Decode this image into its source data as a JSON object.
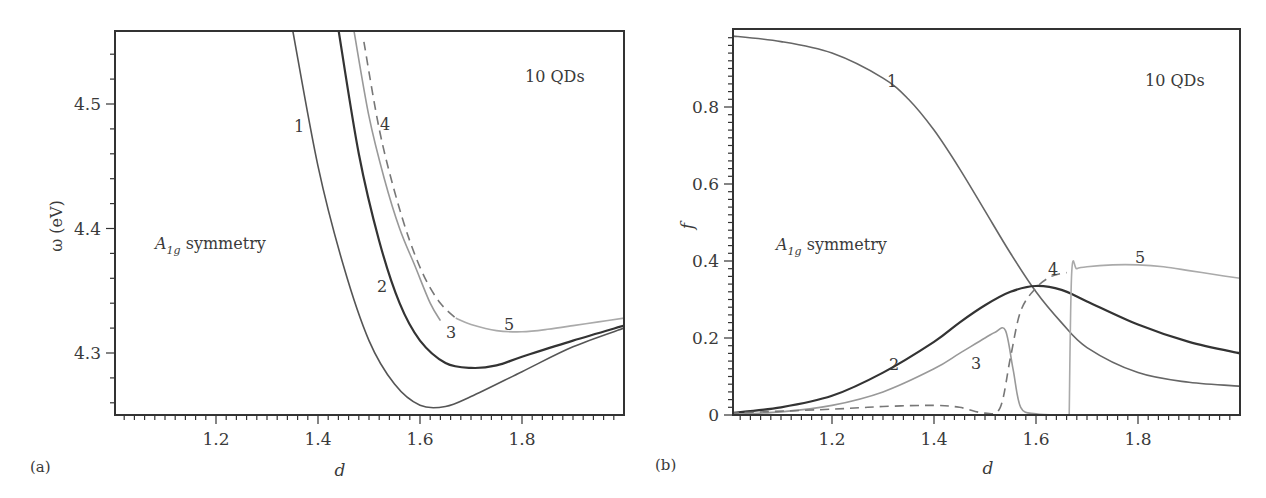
{
  "figure": {
    "panels": [
      {
        "id": "a",
        "panel_label": "(a)",
        "xlabel": "d",
        "ylabel": "ω (eV)",
        "annotation_top": "10 QDs",
        "annotation_symmetry": "A",
        "annotation_symmetry_sub": "1g",
        "annotation_symmetry_text": " symmetry",
        "xticks": [
          "1.2",
          "1.4",
          "1.6",
          "1.8"
        ],
        "yticks": [
          "4.3",
          "4.4",
          "4.5"
        ],
        "curve_labels": [
          "1",
          "2",
          "3",
          "4",
          "5"
        ]
      },
      {
        "id": "b",
        "panel_label": "(b)",
        "xlabel": "d",
        "ylabel": "f",
        "annotation_top": "10 QDs",
        "annotation_symmetry": "A",
        "annotation_symmetry_sub": "1g",
        "annotation_symmetry_text": " symmetry",
        "xticks": [
          "1.2",
          "1.4",
          "1.6",
          "1.8"
        ],
        "yticks": [
          "0",
          "0.2",
          "0.4",
          "0.6",
          "0.8"
        ],
        "curve_labels": [
          "1",
          "2",
          "3",
          "4",
          "5"
        ]
      }
    ]
  },
  "chart_data": [
    {
      "type": "line",
      "title": "(a) Excitation energies, 10 QDs, A1g symmetry",
      "xlabel": "d",
      "ylabel": "ω (eV)",
      "xlim": [
        1.0,
        2.0
      ],
      "ylim": [
        4.25,
        4.56
      ],
      "grid": false,
      "legend": "inline curve numbers",
      "series": [
        {
          "name": "1",
          "style": "solid",
          "color": "#555555",
          "x": [
            1.35,
            1.4,
            1.45,
            1.5,
            1.55,
            1.6,
            1.65,
            1.7,
            1.8,
            1.9,
            2.0
          ],
          "y": [
            4.56,
            4.45,
            4.37,
            4.31,
            4.275,
            4.258,
            4.257,
            4.265,
            4.285,
            4.305,
            4.32
          ]
        },
        {
          "name": "2",
          "style": "solid",
          "color": "#333333",
          "x": [
            1.44,
            1.48,
            1.52,
            1.56,
            1.6,
            1.65,
            1.7,
            1.75,
            1.8,
            1.9,
            2.0
          ],
          "y": [
            4.56,
            4.46,
            4.39,
            4.34,
            4.31,
            4.292,
            4.288,
            4.29,
            4.297,
            4.31,
            4.322
          ]
        },
        {
          "name": "3",
          "style": "solid",
          "color": "#999999",
          "x": [
            1.47,
            1.5,
            1.53,
            1.56,
            1.59,
            1.62,
            1.64
          ],
          "y": [
            4.56,
            4.49,
            4.44,
            4.4,
            4.37,
            4.34,
            4.326
          ]
        },
        {
          "name": "4",
          "style": "dashed",
          "color": "#777777",
          "x": [
            1.49,
            1.52,
            1.55,
            1.58,
            1.61,
            1.64,
            1.67
          ],
          "y": [
            4.55,
            4.48,
            4.43,
            4.39,
            4.36,
            4.34,
            4.328
          ]
        },
        {
          "name": "5",
          "style": "solid",
          "color": "#aaaaaa",
          "x": [
            1.67,
            1.7,
            1.75,
            1.8,
            1.85,
            1.9,
            1.95,
            2.0
          ],
          "y": [
            4.328,
            4.323,
            4.318,
            4.317,
            4.319,
            4.322,
            4.325,
            4.328
          ]
        }
      ],
      "annotations": [
        "10 QDs",
        "A1g symmetry"
      ]
    },
    {
      "type": "line",
      "title": "(b) Oscillator strengths, 10 QDs, A1g symmetry",
      "xlabel": "d",
      "ylabel": "f",
      "xlim": [
        1.0,
        2.0
      ],
      "ylim": [
        0,
        1.0
      ],
      "grid": false,
      "legend": "inline curve numbers",
      "series": [
        {
          "name": "1",
          "style": "solid",
          "color": "#666666",
          "x": [
            1.0,
            1.1,
            1.2,
            1.3,
            1.35,
            1.4,
            1.45,
            1.5,
            1.55,
            1.6,
            1.65,
            1.7,
            1.8,
            1.9,
            2.0
          ],
          "y": [
            0.985,
            0.97,
            0.94,
            0.875,
            0.82,
            0.74,
            0.64,
            0.53,
            0.42,
            0.32,
            0.24,
            0.175,
            0.11,
            0.085,
            0.075
          ]
        },
        {
          "name": "2",
          "style": "solid",
          "color": "#333333",
          "x": [
            1.0,
            1.1,
            1.2,
            1.3,
            1.4,
            1.45,
            1.5,
            1.55,
            1.6,
            1.65,
            1.7,
            1.8,
            1.9,
            2.0
          ],
          "y": [
            0.005,
            0.02,
            0.05,
            0.11,
            0.19,
            0.24,
            0.285,
            0.32,
            0.335,
            0.325,
            0.295,
            0.235,
            0.19,
            0.16
          ]
        },
        {
          "name": "3",
          "style": "solid",
          "color": "#999999",
          "x": [
            1.0,
            1.1,
            1.2,
            1.3,
            1.4,
            1.45,
            1.5,
            1.52,
            1.54,
            1.555,
            1.57,
            1.6,
            1.65
          ],
          "y": [
            0.002,
            0.008,
            0.025,
            0.06,
            0.12,
            0.16,
            0.2,
            0.215,
            0.22,
            0.12,
            0.02,
            0.003,
            0.0
          ]
        },
        {
          "name": "4",
          "style": "dashed",
          "color": "#777777",
          "x": [
            1.0,
            1.2,
            1.3,
            1.4,
            1.45,
            1.5,
            1.53,
            1.55,
            1.57,
            1.6,
            1.63,
            1.66
          ],
          "y": [
            0.005,
            0.015,
            0.022,
            0.025,
            0.02,
            0.005,
            0.02,
            0.15,
            0.27,
            0.33,
            0.36,
            0.37
          ]
        },
        {
          "name": "5",
          "style": "solid",
          "color": "#aaaaaa",
          "x": [
            1.665,
            1.67,
            1.68,
            1.7,
            1.75,
            1.8,
            1.85,
            1.9,
            1.95,
            2.0
          ],
          "y": [
            0.0,
            0.37,
            0.38,
            0.385,
            0.39,
            0.39,
            0.385,
            0.375,
            0.365,
            0.355
          ]
        }
      ],
      "annotations": [
        "10 QDs",
        "A1g symmetry"
      ]
    }
  ]
}
